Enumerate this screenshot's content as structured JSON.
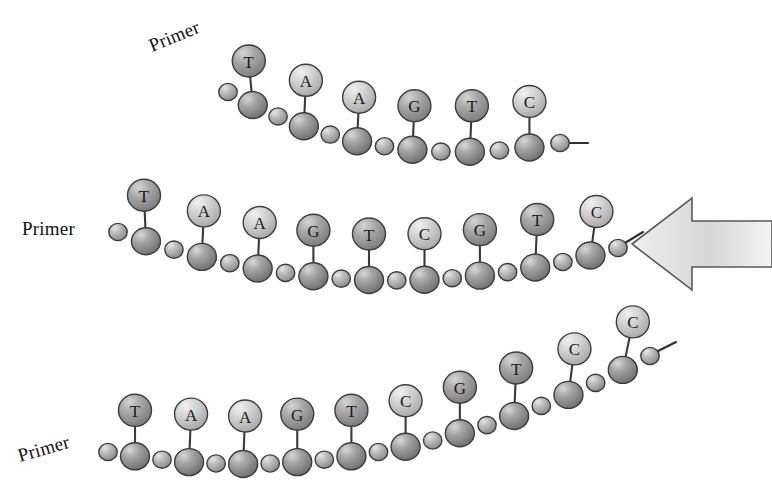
{
  "figure": {
    "background_color": "#ffffff",
    "outline_color": "#3a3a3a"
  },
  "palette": {
    "backbone_dark": "#8d8d8d",
    "backbone_light": "#b6b6b6",
    "base_dark": "#9a9a9a",
    "base_light": "#cfcfcf",
    "arrow_fill": "#d2d2d2",
    "arrow_edge": "#555555",
    "text": "#111111"
  },
  "arrow": {
    "name": "left-pointing-arrow",
    "direction": "left",
    "fill": "#d2d2d2",
    "x": 632,
    "y": 196,
    "width": 140,
    "height": 96
  },
  "strands": [
    {
      "id": "strand-top",
      "primer_label": "Primer",
      "primer_x": 152,
      "primer_y": 52,
      "primer_rotation": -22,
      "bases": [
        "T",
        "A",
        "A",
        "G",
        "T",
        "C"
      ],
      "base_count": 6,
      "backbone_units": 13
    },
    {
      "id": "strand-middle",
      "primer_label": "Primer",
      "primer_x": 22,
      "primer_y": 235,
      "primer_rotation": 0,
      "bases": [
        "T",
        "A",
        "A",
        "G",
        "T",
        "C",
        "G",
        "T",
        "C"
      ],
      "base_count": 9,
      "backbone_units": 19
    },
    {
      "id": "strand-bottom",
      "primer_label": "Primer",
      "primer_x": 20,
      "primer_y": 462,
      "primer_rotation": -16,
      "bases": [
        "T",
        "A",
        "A",
        "G",
        "T",
        "C",
        "G",
        "T",
        "C",
        "C"
      ],
      "base_count": 10,
      "backbone_units": 21
    }
  ]
}
